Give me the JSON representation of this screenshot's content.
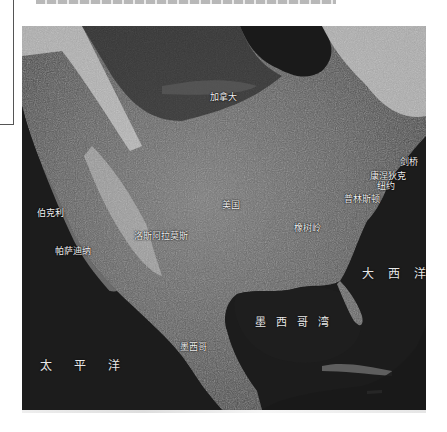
{
  "figure": {
    "top_text_cutoff": "",
    "map_type": "satellite image of North America"
  },
  "labels": {
    "canada": "加拿大",
    "usa": "美国",
    "mexico": "墨西哥",
    "berkeley": "伯克利",
    "pasadena": "帕萨迪纳",
    "los_alamos": "洛斯阿拉莫斯",
    "oak_ridge": "橡树岭",
    "cambridge": "剑桥",
    "connecticut": "康涅狄克",
    "new_york": "纽约",
    "princeton": "普林斯顿"
  },
  "oceans": {
    "pacific": "太平洋",
    "atlantic": "大西洋",
    "gulf_of_mexico": "墨西哥湾"
  },
  "colors": {
    "ocean": "#1c1c1c",
    "land": "#6e6e6e",
    "snow": "#d8d8d8",
    "label_text": "#f2f2f2"
  }
}
